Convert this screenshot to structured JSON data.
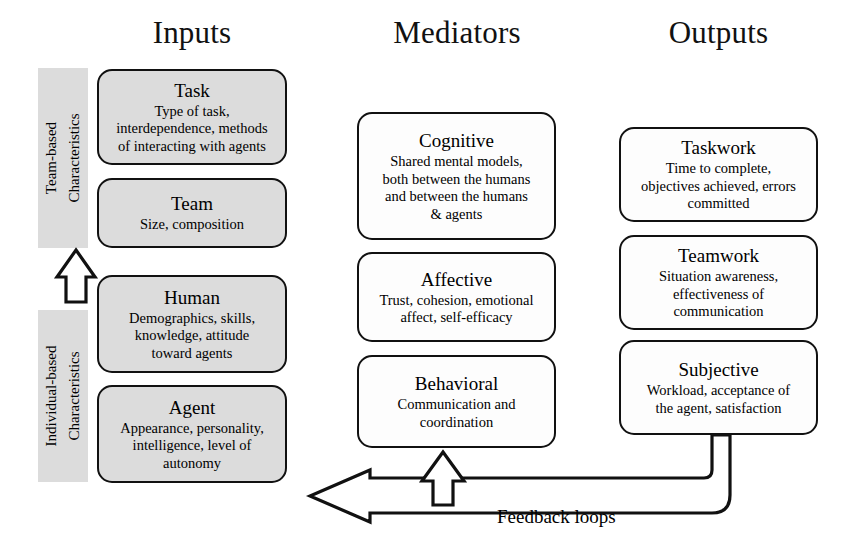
{
  "figure": {
    "type": "conceptual-framework-diagram",
    "background_color": "#ffffff",
    "box_fill_gray": "#dcdcdc",
    "box_fill_white": "#fdfdfd",
    "outline_color": "#111111"
  },
  "columns": {
    "inputs_header": "Inputs",
    "mediators_header": "Mediators",
    "outputs_header": "Outputs"
  },
  "side_labels": {
    "team_based": {
      "line1": "Team-based",
      "line2": "Characteristics"
    },
    "individual_based": {
      "line1": "Individual-based",
      "line2": "Characteristics"
    }
  },
  "inputs": [
    {
      "title": "Task",
      "desc_lines": [
        "Type of task,",
        "interdependence, methods",
        "of interacting with agents"
      ],
      "fill": "gray"
    },
    {
      "title": "Team",
      "desc_lines": [
        "Size, composition"
      ],
      "fill": "gray"
    },
    {
      "title": "Human",
      "desc_lines": [
        "Demographics, skills,",
        "knowledge, attitude",
        "toward agents"
      ],
      "fill": "gray"
    },
    {
      "title": "Agent",
      "desc_lines": [
        "Appearance, personality,",
        "intelligence, level of",
        "autonomy"
      ],
      "fill": "gray"
    }
  ],
  "mediators": [
    {
      "title": "Cognitive",
      "desc_lines": [
        "Shared mental models,",
        "both between the humans",
        "and between the humans",
        "& agents"
      ],
      "fill": "white"
    },
    {
      "title": "Affective",
      "desc_lines": [
        "Trust, cohesion, emotional",
        "affect, self-efficacy"
      ],
      "fill": "white"
    },
    {
      "title": "Behavioral",
      "desc_lines": [
        "Communication and",
        "coordination"
      ],
      "fill": "white"
    }
  ],
  "outputs": [
    {
      "title": "Taskwork",
      "desc_lines": [
        "Time to complete,",
        "objectives achieved, errors",
        "committed"
      ],
      "fill": "white"
    },
    {
      "title": "Teamwork",
      "desc_lines": [
        "Situation awareness,",
        "effectiveness of",
        "communication"
      ],
      "fill": "white"
    },
    {
      "title": "Subjective",
      "desc_lines": [
        "Workload, acceptance of",
        "the agent, satisfaction"
      ],
      "fill": "white"
    }
  ],
  "annotations": {
    "feedback_loops": "Feedback loops"
  }
}
